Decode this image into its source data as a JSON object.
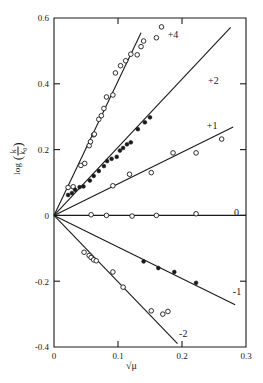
{
  "chart_data": {
    "type": "scatter",
    "title": "",
    "xlabel": "√μ",
    "ylabel": "log (k/k₀)",
    "xlim": [
      0,
      0.3
    ],
    "ylim": [
      -0.4,
      0.6
    ],
    "xticks": [
      "0",
      "0.1",
      "0.2",
      "0.3"
    ],
    "xtick_values": [
      0,
      0.1,
      0.2,
      0.3
    ],
    "yticks": [
      "0.6",
      "0.4",
      "0.2",
      "0",
      "-0.2",
      "-0.4"
    ],
    "ytick_values": [
      0.6,
      0.4,
      0.2,
      0,
      -0.2,
      -0.4
    ],
    "grid": false,
    "legend_position": "inline-right-of-each-line",
    "annotations": [
      {
        "label": "+4",
        "x": 0.186,
        "y": 0.551
      },
      {
        "label": "+2",
        "x": 0.249,
        "y": 0.41
      },
      {
        "label": "+1",
        "x": 0.247,
        "y": 0.272
      },
      {
        "label": "0",
        "x": 0.285,
        "y": 0.008
      },
      {
        "label": "-1",
        "x": 0.286,
        "y": -0.232
      },
      {
        "label": "-2",
        "x": 0.202,
        "y": -0.36
      }
    ],
    "series": [
      {
        "name": "+4",
        "slope": 4.08,
        "marker": "open-circle",
        "line_x": [
          0,
          0.136
        ],
        "points": [
          {
            "x": 0.022,
            "y": 0.085
          },
          {
            "x": 0.03,
            "y": 0.087
          },
          {
            "x": 0.042,
            "y": 0.152
          },
          {
            "x": 0.048,
            "y": 0.158
          },
          {
            "x": 0.055,
            "y": 0.212
          },
          {
            "x": 0.057,
            "y": 0.224
          },
          {
            "x": 0.062,
            "y": 0.245
          },
          {
            "x": 0.063,
            "y": 0.247
          },
          {
            "x": 0.07,
            "y": 0.292
          },
          {
            "x": 0.074,
            "y": 0.303
          },
          {
            "x": 0.078,
            "y": 0.325
          },
          {
            "x": 0.082,
            "y": 0.36
          },
          {
            "x": 0.092,
            "y": 0.366
          },
          {
            "x": 0.096,
            "y": 0.433
          },
          {
            "x": 0.104,
            "y": 0.455
          },
          {
            "x": 0.112,
            "y": 0.47
          },
          {
            "x": 0.12,
            "y": 0.49
          },
          {
            "x": 0.13,
            "y": 0.488
          },
          {
            "x": 0.136,
            "y": 0.513
          },
          {
            "x": 0.14,
            "y": 0.53
          },
          {
            "x": 0.16,
            "y": 0.54
          },
          {
            "x": 0.168,
            "y": 0.573
          }
        ]
      },
      {
        "name": "+2",
        "slope": 2.07,
        "marker": "filled-circle",
        "line_x": [
          0,
          0.276
        ],
        "points": [
          {
            "x": 0.022,
            "y": 0.062
          },
          {
            "x": 0.028,
            "y": 0.068
          },
          {
            "x": 0.033,
            "y": 0.078
          },
          {
            "x": 0.04,
            "y": 0.086
          },
          {
            "x": 0.046,
            "y": 0.088
          },
          {
            "x": 0.056,
            "y": 0.106
          },
          {
            "x": 0.062,
            "y": 0.12
          },
          {
            "x": 0.07,
            "y": 0.135
          },
          {
            "x": 0.078,
            "y": 0.15
          },
          {
            "x": 0.083,
            "y": 0.165
          },
          {
            "x": 0.09,
            "y": 0.172
          },
          {
            "x": 0.098,
            "y": 0.178
          },
          {
            "x": 0.103,
            "y": 0.197
          },
          {
            "x": 0.108,
            "y": 0.205
          },
          {
            "x": 0.114,
            "y": 0.216
          },
          {
            "x": 0.12,
            "y": 0.222
          },
          {
            "x": 0.131,
            "y": 0.262
          },
          {
            "x": 0.142,
            "y": 0.283
          },
          {
            "x": 0.15,
            "y": 0.298
          }
        ]
      },
      {
        "name": "+1",
        "slope": 0.96,
        "marker": "open-circle",
        "line_x": [
          0,
          0.28
        ],
        "points": [
          {
            "x": 0.092,
            "y": 0.09
          },
          {
            "x": 0.118,
            "y": 0.125
          },
          {
            "x": 0.152,
            "y": 0.13
          },
          {
            "x": 0.186,
            "y": 0.19
          },
          {
            "x": 0.222,
            "y": 0.19
          },
          {
            "x": 0.262,
            "y": 0.232
          }
        ]
      },
      {
        "name": "0",
        "slope": 0.0,
        "marker": "open-circle",
        "line_x": [
          0,
          0.3
        ],
        "points": [
          {
            "x": 0.058,
            "y": 0.002
          },
          {
            "x": 0.082,
            "y": 0.0
          },
          {
            "x": 0.122,
            "y": -0.002
          },
          {
            "x": 0.16,
            "y": 0.0
          },
          {
            "x": 0.222,
            "y": 0.005
          }
        ]
      },
      {
        "name": "-1",
        "slope": -0.96,
        "marker": "filled-circle",
        "line_x": [
          0,
          0.283
        ],
        "points": [
          {
            "x": 0.14,
            "y": -0.14
          },
          {
            "x": 0.163,
            "y": -0.16
          },
          {
            "x": 0.188,
            "y": -0.172
          },
          {
            "x": 0.222,
            "y": -0.205
          }
        ]
      },
      {
        "name": "-2",
        "slope": -2.02,
        "marker": "open-circle",
        "line_x": [
          0,
          0.193
        ],
        "points": [
          {
            "x": 0.047,
            "y": -0.112
          },
          {
            "x": 0.055,
            "y": -0.122
          },
          {
            "x": 0.058,
            "y": -0.128
          },
          {
            "x": 0.062,
            "y": -0.135
          },
          {
            "x": 0.066,
            "y": -0.138
          },
          {
            "x": 0.092,
            "y": -0.172
          },
          {
            "x": 0.108,
            "y": -0.218
          },
          {
            "x": 0.152,
            "y": -0.29
          },
          {
            "x": 0.17,
            "y": -0.3
          },
          {
            "x": 0.178,
            "y": -0.292
          }
        ]
      }
    ]
  },
  "axes": {
    "y_title_prefix": "log",
    "y_title_numerator": "k",
    "y_title_denominator": "k₀",
    "x_title": "√μ"
  }
}
